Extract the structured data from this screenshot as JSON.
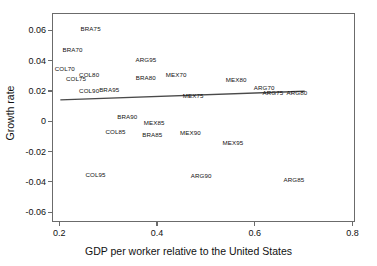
{
  "chart_data": {
    "type": "scatter",
    "title": "",
    "xlabel": "GDP per worker relative to the United States",
    "ylabel": "Growth rate",
    "xlim": [
      0.185,
      0.805
    ],
    "ylim": [
      -0.0665,
      0.0715
    ],
    "xticks": [
      0.2,
      0.4,
      0.6,
      0.8
    ],
    "xticklabels": [
      "0.2",
      "0.4",
      "0.6",
      "0.8"
    ],
    "yticks": [
      0.06,
      0.04,
      0.02,
      0,
      -0.02,
      -0.04,
      -0.06
    ],
    "yticklabels": [
      "0.06",
      "0.04",
      "0.02",
      "0",
      "-0.02",
      "-0.04",
      "-0.06"
    ],
    "grid": false,
    "legend": "none",
    "marker_style": "text-label-only",
    "points": [
      {
        "label": "BRA75",
        "x": 0.262,
        "y": 0.0622
      },
      {
        "label": "BRA70",
        "x": 0.225,
        "y": 0.0481
      },
      {
        "label": "COL70",
        "x": 0.209,
        "y": 0.036
      },
      {
        "label": "ARG95",
        "x": 0.375,
        "y": 0.0417
      },
      {
        "label": "COL80",
        "x": 0.259,
        "y": 0.0318
      },
      {
        "label": "COL75",
        "x": 0.232,
        "y": 0.029
      },
      {
        "label": "BRA80",
        "x": 0.375,
        "y": 0.0297
      },
      {
        "label": "MEX70",
        "x": 0.437,
        "y": 0.0318
      },
      {
        "label": "MEX80",
        "x": 0.56,
        "y": 0.0283
      },
      {
        "label": "COL90",
        "x": 0.259,
        "y": 0.0212
      },
      {
        "label": "BRA95",
        "x": 0.3,
        "y": 0.0219
      },
      {
        "label": "MEX75",
        "x": 0.472,
        "y": 0.0177
      },
      {
        "label": "ARG70",
        "x": 0.617,
        "y": 0.0233
      },
      {
        "label": "ARG75",
        "x": 0.635,
        "y": 0.0198
      },
      {
        "label": "ARG80",
        "x": 0.684,
        "y": 0.0198
      },
      {
        "label": "BRA90",
        "x": 0.337,
        "y": 0.0042
      },
      {
        "label": "MEX85",
        "x": 0.392,
        "y": 0.0
      },
      {
        "label": "COL85",
        "x": 0.313,
        "y": -0.0057
      },
      {
        "label": "BRA85",
        "x": 0.388,
        "y": -0.0078
      },
      {
        "label": "MEX90",
        "x": 0.466,
        "y": -0.0064
      },
      {
        "label": "MEX95",
        "x": 0.553,
        "y": -0.0127
      },
      {
        "label": "COL95",
        "x": 0.272,
        "y": -0.0339
      },
      {
        "label": "ARG90",
        "x": 0.488,
        "y": -0.0346
      },
      {
        "label": "ARG85",
        "x": 0.678,
        "y": -0.0375
      }
    ],
    "trendline": {
      "name": "fitted regression line",
      "x_start": 0.2,
      "y_start": 0.0148,
      "x_end": 0.7,
      "y_end": 0.0205,
      "color": "#4a4a4a"
    }
  },
  "style": {
    "frame_color": "#6b6b6b",
    "text_color": "#111111",
    "background": "#ffffff"
  }
}
